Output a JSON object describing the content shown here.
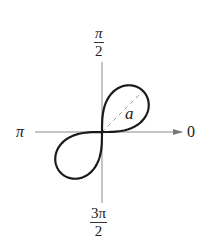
{
  "diagram": {
    "type": "polar-graph",
    "curve": "lemniscate",
    "labels": {
      "top": {
        "num": "π",
        "den": "2"
      },
      "bottom": {
        "num": "3π",
        "den": "2"
      },
      "left": "π",
      "right": "0",
      "radius": "a"
    },
    "colors": {
      "curve": "#1a1a1a",
      "axis": "#8a8a8a",
      "dashed": "#9a9a9a",
      "text": "#222222"
    }
  },
  "chart_data": {
    "type": "line",
    "title": "",
    "equation": "r^2 = a^2 sin(2θ)",
    "coordinate_system": "polar",
    "axis_labels": {
      "theta_0": "0",
      "theta_pi_over_2": "π/2",
      "theta_pi": "π",
      "theta_3pi_over_2": "3π/2"
    },
    "annotation": {
      "text": "a",
      "meaning": "distance from pole to loop tip along θ = π/4 (dashed)"
    },
    "params": {
      "a_px": 58,
      "origin_px": [
        102,
        132
      ]
    },
    "loops": [
      "first quadrant (0 ≤ θ ≤ π/2)",
      "third quadrant (π ≤ θ ≤ 3π/2)"
    ],
    "grid": false
  }
}
